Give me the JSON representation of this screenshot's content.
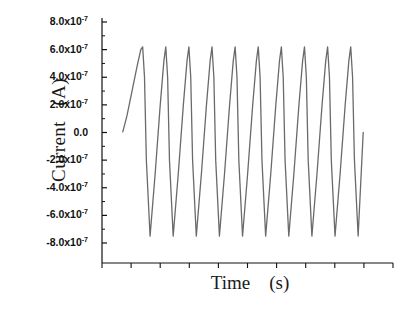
{
  "chart_data": {
    "type": "line",
    "title": "",
    "xlabel": "Time    (s)",
    "ylabel": "Current   (A)",
    "ylim": [
      -8.5e-07,
      8.5e-07
    ],
    "xlim": [
      0,
      10.5
    ],
    "grid": false,
    "legend": null,
    "y_tick_labels": [
      "8.0x10-7",
      "6.0x10-7",
      "4.0x10-7",
      "2.0x10-7",
      "0.0",
      "-2.0x10-7",
      "-4.0x10-7",
      "-6.0x10-7",
      "-8.0x10-7"
    ],
    "y_tick_values": [
      8e-07,
      6e-07,
      4e-07,
      2e-07,
      0.0,
      -2e-07,
      -4e-07,
      -6e-07,
      -8e-07
    ],
    "y_tick_mantissas": [
      "8.0",
      "6.0",
      "4.0",
      "2.0",
      "0.0",
      "-2.0",
      "-4.0",
      "-6.0",
      "-8.0"
    ],
    "y_tick_exponent": "-7",
    "x_tick_labels": [],
    "x_tick_count": 10,
    "series": [
      {
        "name": "current",
        "color": "#6a6a6a",
        "line_width": 1.3,
        "waveform": "spike-sawtooth",
        "cycles": 10,
        "peak_value": 6.2e-07,
        "trough_value": -7.5e-07,
        "start_value": 5e-09,
        "end_value": 0.0,
        "x": [
          0.12,
          0.3,
          0.52,
          0.74,
          0.9,
          0.98,
          1.06,
          1.14,
          1.3,
          1.52,
          1.74,
          1.9,
          1.98,
          2.06,
          2.14,
          2.3,
          2.52,
          2.74,
          2.9,
          2.98,
          3.06,
          3.14,
          3.3,
          3.52,
          3.74,
          3.9,
          3.98,
          4.06,
          4.14,
          4.3,
          4.52,
          4.74,
          4.9,
          4.98,
          5.06,
          5.14,
          5.3,
          5.52,
          5.74,
          5.9,
          5.98,
          6.06,
          6.14,
          6.3,
          6.52,
          6.74,
          6.9,
          6.98,
          7.06,
          7.14,
          7.3,
          7.52,
          7.74,
          7.9,
          7.98,
          8.06,
          8.14,
          8.3,
          8.52,
          8.74,
          8.9,
          8.98,
          9.06,
          9.14,
          9.3,
          9.52,
          9.74,
          9.9,
          9.98,
          10.06,
          10.14,
          10.3,
          10.52
        ],
        "y": [
          5e-09,
          1.2e-07,
          3e-07,
          4.8e-07,
          6e-07,
          6.2e-07,
          4e-07,
          -2e-07,
          -7.5e-07,
          -3e-07,
          2e-07,
          5.2e-07,
          6.2e-07,
          4e-07,
          -2e-07,
          -7.5e-07,
          -3e-07,
          2e-07,
          5.2e-07,
          6.2e-07,
          4e-07,
          -2e-07,
          -7.5e-07,
          -3e-07,
          2e-07,
          5.2e-07,
          6.2e-07,
          4e-07,
          -2e-07,
          -7.5e-07,
          -3e-07,
          2e-07,
          5.2e-07,
          6.2e-07,
          4e-07,
          -2e-07,
          -7.5e-07,
          -3e-07,
          2e-07,
          5.2e-07,
          6.2e-07,
          4e-07,
          -2e-07,
          -7.5e-07,
          -3e-07,
          2e-07,
          5.2e-07,
          6.2e-07,
          4e-07,
          -2e-07,
          -7.5e-07,
          -3e-07,
          2e-07,
          5.2e-07,
          6.2e-07,
          4e-07,
          -2e-07,
          -7.5e-07,
          -3e-07,
          2e-07,
          5.2e-07,
          6.2e-07,
          4e-07,
          -2e-07,
          -7.5e-07,
          -3e-07,
          2e-07,
          5.2e-07,
          6.2e-07,
          4e-07,
          -2e-07,
          -7.5e-07,
          0.0
        ]
      }
    ],
    "axes_style": {
      "spines": [
        "left",
        "bottom"
      ],
      "axis_color": "#111111",
      "background": "#ffffff",
      "y_major_ticks_inward": true,
      "y_minor_ticks": true,
      "x_ticks_outward": true
    }
  }
}
